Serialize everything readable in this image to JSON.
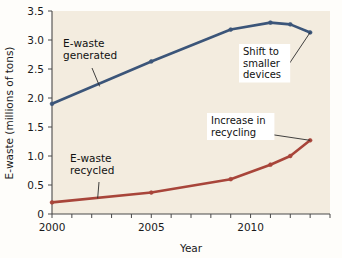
{
  "chart_data": {
    "type": "line",
    "title": "",
    "xlabel": "Year",
    "ylabel": "E-waste (millions of tons)",
    "xlim": [
      2000,
      2014
    ],
    "ylim": [
      0,
      3.5
    ],
    "grid": false,
    "legend": "inline-labels",
    "xticks": [
      2000,
      2001,
      2002,
      2003,
      2004,
      2005,
      2006,
      2007,
      2008,
      2009,
      2010,
      2011,
      2012,
      2013,
      2014
    ],
    "xtick_labels_shown": [
      "2000",
      "2005",
      "2010"
    ],
    "yticks": [
      0,
      0.5,
      1.0,
      1.5,
      2.0,
      2.5,
      3.0,
      3.5
    ],
    "ytick_labels": [
      "0",
      "0.5",
      "1.0",
      "1.5",
      "2.0",
      "2.5",
      "3.0",
      "3.5"
    ],
    "series": [
      {
        "name": "E-waste generated",
        "color": "#3b5579",
        "x": [
          2000,
          2005,
          2009,
          2011,
          2012,
          2013
        ],
        "values": [
          1.9,
          2.63,
          3.18,
          3.3,
          3.27,
          3.13
        ]
      },
      {
        "name": "E-waste recycled",
        "color": "#a8453a",
        "x": [
          2000,
          2005,
          2009,
          2011,
          2012,
          2013
        ],
        "values": [
          0.2,
          0.37,
          0.6,
          0.85,
          1.0,
          1.27
        ]
      }
    ],
    "annotations": [
      {
        "text": "Shift to smaller devices",
        "lines": [
          "Shift to",
          "smaller",
          "devices"
        ],
        "points_to": {
          "x": 2013,
          "y": 3.13
        }
      },
      {
        "text": "Increase in recycling",
        "lines": [
          "Increase in",
          "recycling"
        ],
        "points_to": {
          "x": 2013,
          "y": 1.27
        }
      }
    ],
    "series_callouts": [
      {
        "text": "E-waste generated",
        "lines": [
          "E-waste",
          "generated"
        ],
        "points_to": {
          "x": 2002.4,
          "y": 2.2
        }
      },
      {
        "text": "E-waste recycled",
        "lines": [
          "E-waste",
          "recycled"
        ],
        "points_to": {
          "x": 2002.3,
          "y": 0.27
        }
      }
    ],
    "colors": {
      "plot_background": "#f3ecdf",
      "page_background": "#fefdfa",
      "axis": "#4a4a4a",
      "generated_line": "#3b5579",
      "recycled_line": "#a8453a",
      "text": "#111111",
      "annotation_box": "#ffffff"
    }
  }
}
